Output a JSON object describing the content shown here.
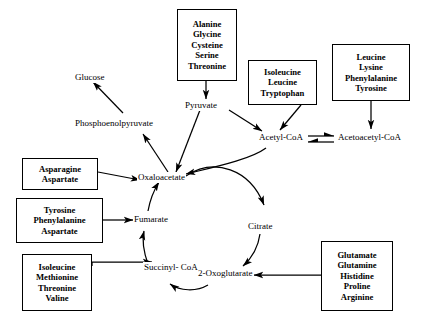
{
  "diagram": {
    "stroke_color": "#000000",
    "background_color": "#ffffff"
  },
  "metabolites": [
    {
      "id": "glucose",
      "label": "Glucose"
    },
    {
      "id": "pep",
      "label": "Phosphoenolpyruvate"
    },
    {
      "id": "pyruvate",
      "label": "Pyruvate"
    },
    {
      "id": "acetyl_coa",
      "label": "Acetyl-CoA"
    },
    {
      "id": "acetoacetyl_coa",
      "label": "Acetoacetyl-CoA"
    },
    {
      "id": "oxaloacetate",
      "label": "Oxaloacetate"
    },
    {
      "id": "citrate",
      "label": "Citrate"
    },
    {
      "id": "oxoglutarate",
      "label": "2-Oxoglutarate"
    },
    {
      "id": "succinyl_coa_line1",
      "label": "Succinyl-"
    },
    {
      "id": "succinyl_coa_line2",
      "label": "CoA"
    },
    {
      "id": "fumarate",
      "label": "Fumarate"
    }
  ],
  "boxes": [
    {
      "id": "box_pyruvate_group",
      "items": [
        "Alanine",
        "Glycine",
        "Cysteine",
        "Serine",
        "Threonine"
      ]
    },
    {
      "id": "box_acetylcoa_group",
      "items": [
        "Isoleucine",
        "Leucine",
        "Tryptophan"
      ]
    },
    {
      "id": "box_acetoacetylcoa_group",
      "items": [
        "Leucine",
        "Lysine",
        "Phenylalanine",
        "Tyrosine"
      ]
    },
    {
      "id": "box_oxaloacetate_group",
      "items": [
        "Asparagine",
        "Aspartate"
      ]
    },
    {
      "id": "box_fumarate_group",
      "items": [
        "Tyrosine",
        "Phenylalanine",
        "Aspartate"
      ]
    },
    {
      "id": "box_succinylcoa_group",
      "items": [
        "Isoleucine",
        "Methionine",
        "Threonine",
        "Valine"
      ]
    },
    {
      "id": "box_oxoglutarate_group",
      "items": [
        "Glutamate",
        "Glutamine",
        "Histidine",
        "Proline",
        "Arginine"
      ]
    }
  ]
}
